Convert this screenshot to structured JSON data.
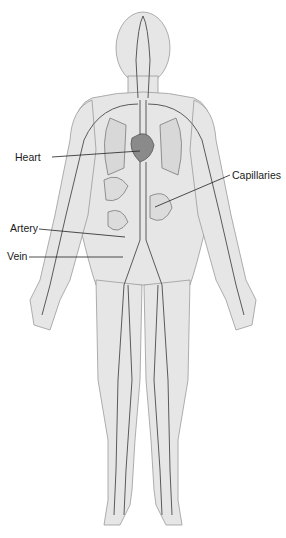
{
  "diagram": {
    "labels": [
      {
        "id": "heart",
        "text": "Heart",
        "x": 15,
        "y": 151,
        "line": [
          52,
          157,
          140,
          151
        ]
      },
      {
        "id": "capillaries",
        "text": "Capillaries",
        "x": 232,
        "y": 169,
        "line": [
          230,
          175,
          155,
          207
        ]
      },
      {
        "id": "artery",
        "text": "Artery",
        "x": 10,
        "y": 222,
        "line": [
          39,
          229,
          125,
          237
        ]
      },
      {
        "id": "vein",
        "text": "Vein",
        "x": 7,
        "y": 250,
        "line": [
          29,
          257,
          123,
          257
        ]
      }
    ],
    "colors": {
      "skin": "#e4e4e4",
      "outline": "#9a9a9a",
      "vessel": "#5a5a5a",
      "organ": "#7a7a7a",
      "leader": "#222222"
    }
  }
}
